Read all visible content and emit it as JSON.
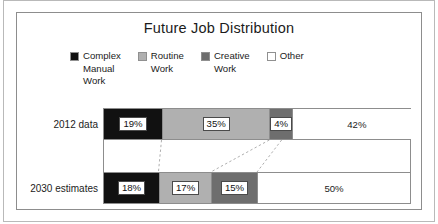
{
  "chart_data": {
    "type": "bar",
    "orientation": "horizontal",
    "stacked": true,
    "normalized": true,
    "title": "Future Job Distribution",
    "xlabel": "",
    "ylabel": "",
    "xlim": [
      0,
      100
    ],
    "grid": false,
    "legend_position": "top",
    "categories": [
      "2012 data",
      "2030 estimates"
    ],
    "series": [
      {
        "name": "Complex Manual Work",
        "color": "#111111",
        "values": [
          19,
          18
        ],
        "labels": [
          "19%",
          "18%"
        ]
      },
      {
        "name": "Routine Work",
        "color": "#b0b0b0",
        "values": [
          35,
          17
        ],
        "labels": [
          "35%",
          "17%"
        ]
      },
      {
        "name": "Creative Work",
        "color": "#6e6e6e",
        "values": [
          4,
          15
        ],
        "labels": [
          "4%",
          "15%"
        ]
      },
      {
        "name": "Other",
        "color": "#ffffff",
        "values": [
          42,
          50
        ],
        "labels": [
          "42%",
          "50%"
        ]
      }
    ]
  },
  "title": "Future Job Distribution",
  "legend": {
    "items": [
      {
        "label": "Complex\nManual\nWork",
        "color": "#111111",
        "swatch_name": "legend-swatch-complex-manual-work"
      },
      {
        "label": "Routine\nWork",
        "color": "#b0b0b0",
        "swatch_name": "legend-swatch-routine-work"
      },
      {
        "label": "Creative\nWork",
        "color": "#6e6e6e",
        "swatch_name": "legend-swatch-creative-work"
      },
      {
        "label": "Other",
        "color": "#ffffff",
        "swatch_name": "legend-swatch-other"
      }
    ]
  },
  "rows": [
    {
      "label": "2012 data",
      "segments": [
        {
          "value": "19%",
          "color": "#111111",
          "pct": 19,
          "boxed": true
        },
        {
          "value": "35%",
          "color": "#b0b0b0",
          "pct": 35,
          "boxed": true
        },
        {
          "value": "4%",
          "color": "#6e6e6e",
          "pct": 4,
          "boxed": true
        },
        {
          "value": "42%",
          "color": "#ffffff",
          "pct": 42,
          "boxed": false
        }
      ]
    },
    {
      "label": "2030 estimates",
      "segments": [
        {
          "value": "18%",
          "color": "#111111",
          "pct": 18,
          "boxed": true
        },
        {
          "value": "17%",
          "color": "#b0b0b0",
          "pct": 17,
          "boxed": true
        },
        {
          "value": "15%",
          "color": "#6e6e6e",
          "pct": 15,
          "boxed": true
        },
        {
          "value": "50%",
          "color": "#ffffff",
          "pct": 50,
          "boxed": false
        }
      ]
    }
  ],
  "colors": {
    "complex_manual_work": "#111111",
    "routine_work": "#b0b0b0",
    "creative_work": "#6e6e6e",
    "other": "#ffffff",
    "border": "#8d8d8d",
    "frame": "#b9b9b9",
    "text": "#1b1b1b"
  }
}
